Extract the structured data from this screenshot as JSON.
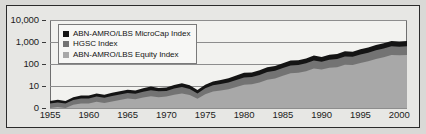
{
  "chart_data": {
    "type": "area",
    "stacked": true,
    "title": "",
    "subtitle": "",
    "xlabel": "",
    "ylabel": "",
    "yscale": "log",
    "ylim": [
      0,
      10000
    ],
    "xlim": [
      1955,
      2001
    ],
    "grid": true,
    "legend_position": "top-left",
    "y_ticks": [
      "0",
      "10",
      "100",
      "1,000",
      "10,000"
    ],
    "y_tick_values": [
      0,
      10,
      100,
      1000,
      10000
    ],
    "x_ticks": [
      "1955",
      "1960",
      "1965",
      "1970",
      "1975",
      "1980",
      "1985",
      "1990",
      "1995",
      "2000"
    ],
    "x_tick_values": [
      1955,
      1960,
      1965,
      1970,
      1975,
      1980,
      1985,
      1990,
      1995,
      2000
    ],
    "x": [
      1955,
      1956,
      1957,
      1958,
      1959,
      1960,
      1961,
      1962,
      1963,
      1964,
      1965,
      1966,
      1967,
      1968,
      1969,
      1970,
      1971,
      1972,
      1973,
      1974,
      1975,
      1976,
      1977,
      1978,
      1979,
      1980,
      1981,
      1982,
      1983,
      1984,
      1985,
      1986,
      1987,
      1988,
      1989,
      1990,
      1991,
      1992,
      1993,
      1994,
      1995,
      1996,
      1997,
      1998,
      1999,
      2000,
      2001
    ],
    "series": [
      {
        "name": "ABN-AMRO/LBS Equity Index",
        "color": "#a8a8a8",
        "stack_order": 1,
        "values": [
          1.0,
          1.1,
          1.0,
          1.4,
          1.6,
          1.6,
          1.9,
          1.7,
          2.0,
          2.3,
          2.7,
          2.5,
          3.0,
          3.4,
          3.1,
          3.3,
          4.0,
          4.6,
          3.9,
          2.6,
          4.2,
          5.6,
          6.2,
          7.2,
          9.0,
          11.5,
          12.0,
          14.5,
          19.0,
          22.0,
          29.0,
          38.0,
          40.0,
          47.0,
          62.0,
          56.0,
          68.0,
          72.0,
          92.0,
          90.0,
          112.0,
          132.0,
          168.0,
          205.0,
          255.0,
          248.0,
          255.0
        ]
      },
      {
        "name": "HGSC Index",
        "color": "#737373",
        "stack_order": 2,
        "values": [
          0.6,
          0.7,
          0.6,
          0.9,
          1.1,
          1.1,
          1.4,
          1.2,
          1.5,
          1.8,
          2.1,
          1.9,
          2.5,
          3.0,
          2.6,
          2.7,
          3.6,
          4.3,
          3.4,
          2.0,
          3.6,
          5.2,
          6.0,
          7.4,
          9.8,
          13.0,
          13.5,
          17.0,
          24.0,
          27.0,
          36.0,
          48.0,
          50.0,
          60.0,
          82.0,
          70.0,
          90.0,
          98.0,
          130.0,
          125.0,
          160.0,
          195.0,
          250.0,
          300.0,
          380.0,
          360.0,
          380.0
        ]
      },
      {
        "name": "ABN-AMRO/LBS MicroCap Index",
        "color": "#141414",
        "stack_order": 3,
        "values": [
          0.5,
          0.6,
          0.5,
          0.8,
          1.0,
          1.0,
          1.3,
          1.1,
          1.4,
          1.7,
          2.0,
          1.8,
          2.4,
          3.0,
          2.5,
          2.6,
          3.6,
          4.4,
          3.4,
          1.9,
          3.5,
          5.4,
          6.4,
          8.0,
          11.0,
          15.0,
          15.5,
          20.0,
          29.0,
          32.0,
          43.0,
          58.0,
          60.0,
          73.0,
          100.0,
          82.0,
          108.0,
          118.0,
          158.0,
          150.0,
          195.0,
          240.0,
          310.0,
          370.0,
          480.0,
          450.0,
          480.0
        ]
      }
    ]
  },
  "legend": {
    "items": [
      {
        "label": "ABN-AMRO/LBS MicroCap Index",
        "color": "#141414"
      },
      {
        "label": "HGSC Index",
        "color": "#737373"
      },
      {
        "label": "ABN-AMRO/LBS Equity Index",
        "color": "#a8a8a8"
      }
    ]
  }
}
